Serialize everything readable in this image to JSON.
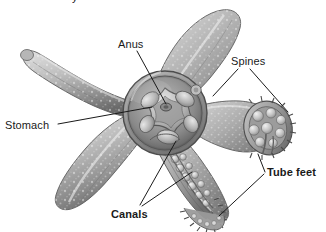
{
  "figure": {
    "clipped_top_text": "y",
    "background_color": "#ffffff",
    "ink_color": "#1a1a1a",
    "width": 326,
    "height": 232
  },
  "labels": {
    "anus": "Anus",
    "spines": "Spines",
    "stomach": "Stomach",
    "tube_feet": "Tube feet",
    "canals": "Canals"
  },
  "organism": {
    "name": "starfish",
    "arm_count": 5,
    "body_tone_light": "#d8d8d8",
    "body_tone_mid": "#a8a8a8",
    "body_tone_dark": "#6e6e6e",
    "speckle_color": "#f4f4f4"
  },
  "annotations": [
    {
      "id": "anus",
      "label": "Anus",
      "bold": false,
      "leader": "single",
      "target": "central disc opening"
    },
    {
      "id": "spines",
      "label": "Spines",
      "bold": false,
      "leader": "forked",
      "target": "arm surface and cut arm rim"
    },
    {
      "id": "stomach",
      "label": "Stomach",
      "bold": false,
      "leader": "single",
      "target": "lobed stomach in central disc"
    },
    {
      "id": "tube_feet",
      "label": "Tube feet",
      "bold": true,
      "leader": "forked",
      "target": "right cut arm and lower arm underside"
    },
    {
      "id": "canals",
      "label": "Canals",
      "bold": true,
      "leader": "forked",
      "target": "radial canals in lower cut arm"
    }
  ]
}
